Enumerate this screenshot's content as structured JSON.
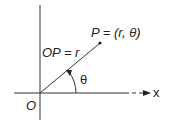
{
  "diagram": {
    "point_label": "P = (r, θ)",
    "segment_label": "OP = r",
    "angle_label": "θ",
    "origin_label": "O",
    "axis_label": "x",
    "colors": {
      "line": "#222222",
      "background": "#ffffff"
    }
  }
}
